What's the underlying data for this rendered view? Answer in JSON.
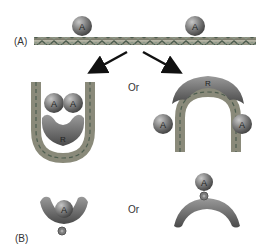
{
  "labels": {
    "panel_a": "(A)",
    "panel_b": "(B)",
    "or_top": "Or",
    "or_bottom": "Or"
  },
  "molecules": {
    "activator": "A",
    "repressor": "R"
  },
  "colors": {
    "dna_base": "#9a9a8a",
    "dna_strand_dark": "#5a6a5a",
    "ball_fill": "#707070",
    "ball_highlight": "#b8b8b8",
    "repressor_fill": "#6e6e6e",
    "arrow": "#111111"
  }
}
